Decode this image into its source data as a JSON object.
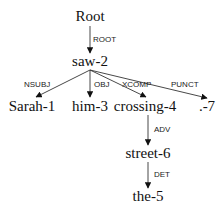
{
  "diagram": {
    "type": "dependency-parse-tree",
    "nodes": [
      {
        "id": "root",
        "label": "Root",
        "x": 90,
        "y": 21
      },
      {
        "id": "saw",
        "label": "saw-2",
        "x": 90,
        "y": 66
      },
      {
        "id": "sarah",
        "label": "Sarah-1",
        "x": 32,
        "y": 111
      },
      {
        "id": "him",
        "label": "him-3",
        "x": 90,
        "y": 111
      },
      {
        "id": "crossing",
        "label": "crossing-4",
        "x": 145,
        "y": 111
      },
      {
        "id": "punct",
        "label": ".-7",
        "x": 207,
        "y": 111
      },
      {
        "id": "street",
        "label": "street-6",
        "x": 148,
        "y": 158
      },
      {
        "id": "the",
        "label": "the-5",
        "x": 148,
        "y": 201
      }
    ],
    "edges": [
      {
        "from": "root",
        "to": "saw",
        "label": "ROOT",
        "x1": 90,
        "y1": 26,
        "x2": 90,
        "y2": 53,
        "lx": 93,
        "ly": 42
      },
      {
        "from": "saw",
        "to": "sarah",
        "label": "NSUBJ",
        "x1": 90,
        "y1": 70,
        "x2": 36,
        "y2": 97,
        "lx": 24,
        "ly": 87
      },
      {
        "from": "saw",
        "to": "him",
        "label": "OBJ",
        "x1": 90,
        "y1": 70,
        "x2": 90,
        "y2": 97,
        "lx": 94,
        "ly": 87
      },
      {
        "from": "saw",
        "to": "crossing",
        "label": "XCOMP",
        "x1": 90,
        "y1": 70,
        "x2": 146,
        "y2": 97,
        "lx": 122,
        "ly": 87
      },
      {
        "from": "saw",
        "to": "punct",
        "label": "PUNCT",
        "x1": 90,
        "y1": 70,
        "x2": 207,
        "y2": 98,
        "lx": 171,
        "ly": 87
      },
      {
        "from": "crossing",
        "to": "street",
        "label": "ADV",
        "x1": 148,
        "y1": 115,
        "x2": 148,
        "y2": 145,
        "lx": 154,
        "ly": 132
      },
      {
        "from": "street",
        "to": "the",
        "label": "DET",
        "x1": 148,
        "y1": 162,
        "x2": 148,
        "y2": 188,
        "lx": 154,
        "ly": 177
      }
    ]
  }
}
